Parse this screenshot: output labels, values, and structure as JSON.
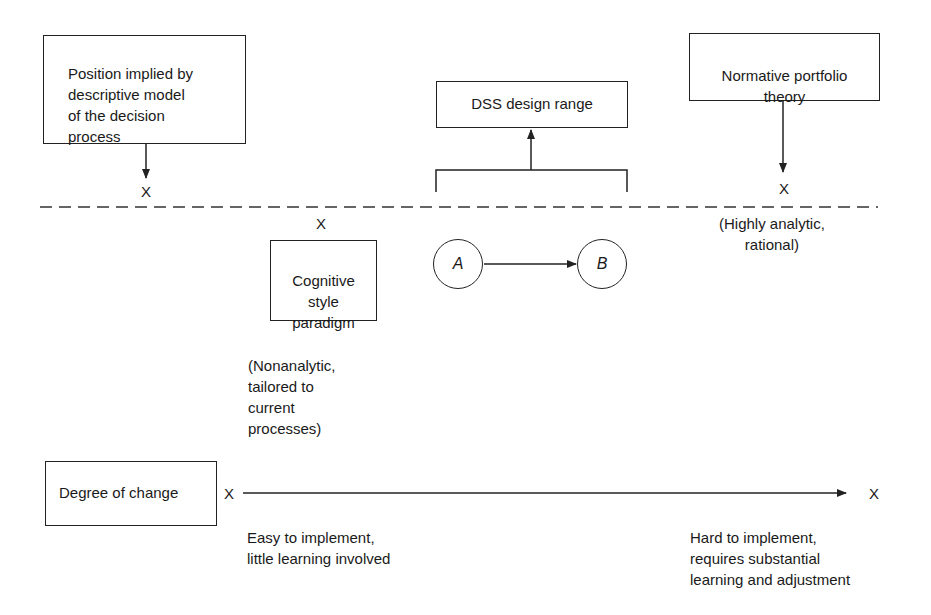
{
  "diagram": {
    "boxes": {
      "descriptive_model": "Position implied by\ndescriptive model\nof the decision\nprocess",
      "dss_design_range": "DSS design range",
      "normative_portfolio": "Normative portfolio\ntheory",
      "cognitive_style": "Cognitive\nstyle\nparadigm",
      "degree_of_change": "Degree of change"
    },
    "markers": {
      "descriptive_x": "X",
      "cognitive_x": "X",
      "normative_x": "X",
      "change_start_x": "X",
      "change_end_x": "X"
    },
    "nodes": {
      "a": "A",
      "b": "B"
    },
    "annotations": {
      "highly_analytic": "(Highly analytic,\nrational)",
      "nonanalytic": "(Nonanalytic,\ntailored to\ncurrent\nprocesses)",
      "easy": "Easy to implement,\nlittle learning involved",
      "hard": "Hard to implement,\nrequires substantial\nlearning and adjustment"
    },
    "colors": {
      "line": "#222222",
      "background": "#ffffff"
    }
  }
}
